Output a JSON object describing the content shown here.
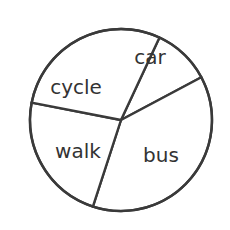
{
  "title": {
    "text": "school travel",
    "visible_state": "cropped-at-top-edge",
    "color": "#8d8d8d"
  },
  "canvas": {
    "width": 230,
    "height": 230,
    "background": "#ffffff"
  },
  "chart_data": {
    "type": "pie",
    "title": "school travel",
    "xlabel": "",
    "ylabel": "",
    "grid": false,
    "legend": "none",
    "labels_position": "inside-slices",
    "stroke_color": "#3a3a3a",
    "stroke_width": 2.4,
    "fill_color": "#ffffff",
    "center": {
      "x": 121,
      "y": 120
    },
    "radius": 91,
    "labels": [
      "car",
      "bus",
      "walk",
      "cycle"
    ],
    "values": [
      37,
      80,
      104,
      139
    ],
    "units": "degrees",
    "fractions": [
      0.103,
      0.222,
      0.289,
      0.386
    ],
    "boundary_angles_deg": [
      -65,
      -28,
      108,
      191
    ],
    "slices": [
      {
        "name": "car",
        "label": "car",
        "start_angle_deg": -65,
        "end_angle_deg": -28,
        "sweep_deg": 37,
        "boundary_point": {
          "x": 82,
          "y": 36
        },
        "label_x": 150,
        "label_y": 58
      },
      {
        "name": "bus",
        "label": "bus",
        "start_angle_deg": -28,
        "end_angle_deg": 108,
        "sweep_deg": 136,
        "boundary_point": {
          "x": 207,
          "y": 77
        },
        "label_x": 161,
        "label_y": 156
      },
      {
        "name": "walk",
        "label": "walk",
        "start_angle_deg": 108,
        "end_angle_deg": 191,
        "sweep_deg": 83,
        "boundary_point": {
          "x": 93,
          "y": 207
        },
        "label_x": 78,
        "label_y": 152
      },
      {
        "name": "cycle",
        "label": "cycle",
        "start_angle_deg": 191,
        "end_angle_deg": 295,
        "sweep_deg": 104,
        "boundary_point": {
          "x": 32,
          "y": 103
        },
        "label_x": 76,
        "label_y": 88
      }
    ]
  }
}
